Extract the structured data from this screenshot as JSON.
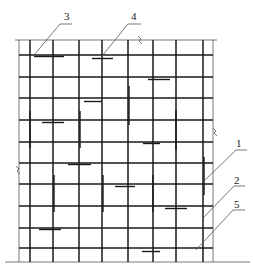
{
  "diagram": {
    "type": "reinforcement-mesh-elevation",
    "colors": {
      "line": "#1a1a1a",
      "thin": "#555555",
      "background": "#ffffff"
    },
    "frame": {
      "left": 19,
      "right": 213,
      "top": 40,
      "bottom": 262,
      "baseline_left": 5,
      "baseline_right": 250
    },
    "vertical_bars_x": [
      30,
      53,
      79,
      102,
      128,
      153,
      176,
      203
    ],
    "horizontal_bars_y": [
      55,
      77,
      98,
      120,
      142,
      163,
      184,
      206,
      228,
      248
    ],
    "lap_bars_horizontal": [
      {
        "x1": 34,
        "x2": 64,
        "y": 55
      },
      {
        "x1": 92,
        "x2": 113,
        "y": 57
      },
      {
        "x1": 148,
        "x2": 170,
        "y": 78
      },
      {
        "x1": 84,
        "x2": 102,
        "y": 100
      },
      {
        "x1": 42,
        "x2": 64,
        "y": 121
      },
      {
        "x1": 143,
        "x2": 160,
        "y": 142
      },
      {
        "x1": 68,
        "x2": 91,
        "y": 163
      },
      {
        "x1": 115,
        "x2": 135,
        "y": 185
      },
      {
        "x1": 165,
        "x2": 187,
        "y": 207
      },
      {
        "x1": 39,
        "x2": 61,
        "y": 228
      },
      {
        "x1": 142,
        "x2": 160,
        "y": 250
      }
    ],
    "lap_bars_vertical": [
      {
        "x": 127,
        "y1": 86,
        "y2": 125
      },
      {
        "x": 28,
        "y1": 111,
        "y2": 148
      },
      {
        "x": 78,
        "y1": 111,
        "y2": 148
      },
      {
        "x": 174,
        "y1": 110,
        "y2": 150
      },
      {
        "x": 202,
        "y1": 157,
        "y2": 195
      },
      {
        "x": 52,
        "y1": 175,
        "y2": 212
      },
      {
        "x": 101,
        "y1": 175,
        "y2": 212
      },
      {
        "x": 151,
        "y1": 175,
        "y2": 212
      }
    ],
    "break_marks": [
      {
        "name": "top-break",
        "x": 140,
        "y": 40
      },
      {
        "name": "right-break",
        "x": 215,
        "y": 132
      },
      {
        "name": "left-break",
        "x": 18,
        "y": 170
      }
    ],
    "callouts": [
      {
        "label": "1",
        "text_x": 236,
        "text_y": 147,
        "line": [
          [
            247,
            150
          ],
          [
            236,
            150
          ],
          [
            203,
            182
          ]
        ]
      },
      {
        "label": "2",
        "text_x": 234,
        "text_y": 184,
        "line": [
          [
            245,
            186
          ],
          [
            234,
            186
          ],
          [
            204,
            217
          ]
        ]
      },
      {
        "label": "3",
        "text_x": 64,
        "text_y": 20,
        "line": [
          [
            72,
            24
          ],
          [
            60,
            24
          ],
          [
            34,
            55
          ]
        ]
      },
      {
        "label": "4",
        "text_x": 131,
        "text_y": 20,
        "line": [
          [
            141,
            24
          ],
          [
            128,
            24
          ],
          [
            102,
            56
          ]
        ]
      },
      {
        "label": "5",
        "text_x": 234,
        "text_y": 208,
        "line": [
          [
            245,
            210
          ],
          [
            233,
            210
          ],
          [
            196,
            250
          ]
        ]
      }
    ]
  }
}
